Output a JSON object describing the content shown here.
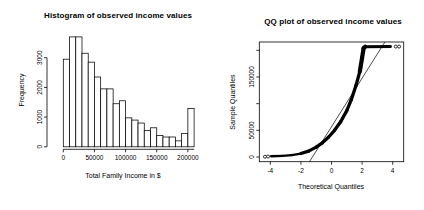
{
  "figure": {
    "background": "#ffffff",
    "foreground": "#000000"
  },
  "chart_data": [
    {
      "type": "bar",
      "subtype": "histogram",
      "title": "Histogram of observed income values",
      "xlabel": "Total Family Income in $",
      "ylabel": "Frequency",
      "bin_start": 0,
      "bin_width": 10000,
      "counts": [
        2950,
        3700,
        3700,
        3150,
        2850,
        2350,
        1950,
        1950,
        1450,
        1550,
        975,
        900,
        800,
        550,
        640,
        380,
        330,
        330,
        200,
        450,
        1290
      ],
      "xticks": [
        0,
        50000,
        100000,
        150000,
        200000
      ],
      "xtick_labels": [
        "0",
        "50000",
        "100000",
        "150000",
        "200000"
      ],
      "yticks": [
        0,
        1000,
        2000,
        3000
      ],
      "ytick_labels": [
        "0",
        "1000",
        "2000",
        "3000"
      ],
      "xlim": [
        0,
        210000
      ],
      "ylim": [
        0,
        3700
      ],
      "bar_fill": "#ffffff",
      "bar_stroke": "#000000",
      "grid": "off"
    },
    {
      "type": "scatter",
      "subtype": "qq-plot",
      "title": "QQ plot of observed income values",
      "xlabel": "Theoretical Quantiles",
      "ylabel": "Sample Quantiles",
      "xticks": [
        -4,
        -2,
        0,
        2,
        4
      ],
      "xtick_labels": [
        "-4",
        "-2",
        "0",
        "2",
        "4"
      ],
      "yticks": [
        0,
        50000,
        100000,
        150000,
        200000
      ],
      "ytick_labels": [
        "0",
        "50000",
        "",
        "150000",
        ""
      ],
      "xlim": [
        -4.72,
        4.72
      ],
      "ylim": [
        -8800,
        215600
      ],
      "dense_curve": [
        [
          -3.95,
          1400
        ],
        [
          -3.2,
          2300
        ],
        [
          -2.6,
          3500
        ],
        [
          -2.0,
          6500
        ],
        [
          -1.5,
          11000
        ],
        [
          -1.0,
          18500
        ],
        [
          -0.6,
          26500
        ],
        [
          -0.2,
          37000
        ],
        [
          0.2,
          50000
        ],
        [
          0.6,
          66000
        ],
        [
          1.0,
          87000
        ],
        [
          1.3,
          108000
        ],
        [
          1.6,
          134000
        ],
        [
          1.85,
          160000
        ],
        [
          2.0,
          186000
        ],
        [
          2.1,
          204000
        ],
        [
          2.2,
          206800
        ],
        [
          3.85,
          207000
        ]
      ],
      "isolated_points": [
        [
          -4.35,
          500
        ],
        [
          -4.15,
          900
        ],
        [
          4.2,
          207000
        ],
        [
          4.42,
          207000
        ]
      ],
      "reference_line": {
        "x1": -1.44,
        "y1": -8800,
        "x2": 3.49,
        "y2": 215600
      },
      "point_color": "#000000",
      "line_color": "#000000",
      "grid": "off"
    }
  ]
}
